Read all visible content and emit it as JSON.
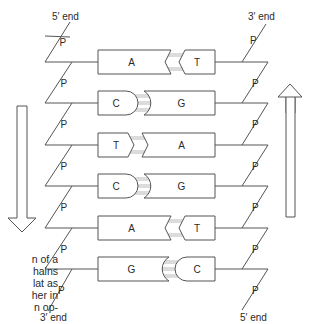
{
  "strand_left": {
    "top_label": "5′ end",
    "bottom_label": "3′ end",
    "phosphate_label": "P"
  },
  "strand_right": {
    "top_label": "3′ end",
    "bottom_label": "5′ end",
    "phosphate_label": "P"
  },
  "base_pairs": [
    {
      "left": "A",
      "right": "T",
      "bond": "double",
      "shape": "chevron"
    },
    {
      "left": "C",
      "right": "G",
      "bond": "triple",
      "shape": "round"
    },
    {
      "left": "T",
      "right": "A",
      "bond": "double",
      "shape": "chevron"
    },
    {
      "left": "C",
      "right": "G",
      "bond": "triple",
      "shape": "round"
    },
    {
      "left": "A",
      "right": "T",
      "bond": "double",
      "shape": "chevron"
    },
    {
      "left": "G",
      "right": "C",
      "bond": "triple",
      "shape": "round"
    }
  ],
  "arrows": {
    "left": "down",
    "right": "up"
  },
  "caption_lines": [
    "n of a",
    "hains",
    "lat as",
    "her in",
    "n op-"
  ],
  "colors": {
    "line": "#555555",
    "hbond": "#b8b8b8",
    "text": "#2a2a2a"
  }
}
